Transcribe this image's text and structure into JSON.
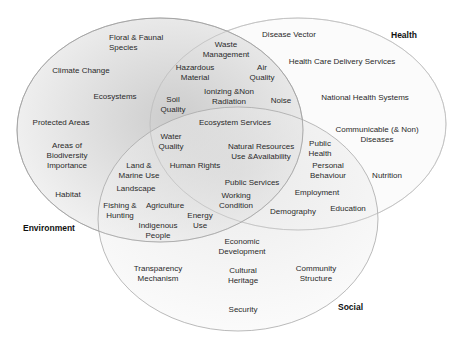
{
  "diagram": {
    "type": "venn",
    "sets": [
      {
        "name": "Environment",
        "fill": "#cfcfcf"
      },
      {
        "name": "Health",
        "fill": "#f2f2f2"
      },
      {
        "name": "Social",
        "fill": "#e6e6e6"
      }
    ],
    "labels": {
      "environment_only": [
        "Floral & Faunal Species",
        "Climate Change",
        "Ecosystems",
        "Protected Areas",
        "Areas of Biodiversity Importance",
        "Habitat"
      ],
      "environment_health": [
        "Waste Management",
        "Hazardous Material",
        "Air Quality",
        "Ionizing &Non Radiation",
        "Soil Quality",
        "Noise"
      ],
      "all_three": [
        "Ecosystem Services",
        "Water Quality",
        "Natural Resources Use &Availability",
        "Human Rights",
        "Public Services",
        "Working Condition"
      ],
      "environment_social": [
        "Land & Marine Use",
        "Landscape",
        "Fishing & Hunting",
        "Agriculture",
        "Energy Use",
        "Indigenous People"
      ],
      "health_only": [
        "Disease Vector",
        "Health Care Delivery Services",
        "National Health Systems",
        "Communicable (& Non) Diseases",
        "Nutrition"
      ],
      "health_social": [
        "Public Health",
        "Personal Behaviour",
        "Employment",
        "Demography",
        "Education"
      ],
      "social_only": [
        "Economic Development",
        "Transparency Mechanism",
        "Cultural Heritage",
        "Community Structure",
        "Security"
      ]
    }
  },
  "items": {
    "floral": [
      "Floral & Faunal",
      "Species"
    ],
    "climate": "Climate Change",
    "ecosystems": "Ecosystems",
    "protected": "Protected Areas",
    "biodiv": [
      "Areas of",
      "Biodiversity",
      "Importance"
    ],
    "habitat": "Habitat",
    "waste": [
      "Waste",
      "Management"
    ],
    "hazard": [
      "Hazardous",
      "Material"
    ],
    "air": [
      "Air",
      "Quality"
    ],
    "ionizing": [
      "Ionizing &Non",
      "Radiation"
    ],
    "soil": [
      "Soil",
      "Quality"
    ],
    "noise": "Noise",
    "ecoserv": "Ecosystem Services",
    "water": [
      "Water",
      "Quality"
    ],
    "natres": [
      "Natural Resources",
      "Use &Availability"
    ],
    "landmarine": [
      "Land &",
      "Marine Use"
    ],
    "humanrights": "Human Rights",
    "landscape": "Landscape",
    "publicserv": "Public Services",
    "fishing": [
      "Fishing &",
      "Hunting"
    ],
    "agriculture": "Agriculture",
    "working": [
      "Working",
      "Condition"
    ],
    "energy": [
      "Energy",
      "Use"
    ],
    "indigenous": [
      "Indigenous",
      "People"
    ],
    "disease": "Disease Vector",
    "hcds": "Health Care Delivery Services",
    "nhs": "National Health Systems",
    "communicable": [
      "Communicable (& Non)",
      "Diseases"
    ],
    "publichealth": [
      "Public",
      "Health"
    ],
    "personal": [
      "Personal",
      "Behaviour"
    ],
    "nutrition": "Nutrition",
    "employment": "Employment",
    "demography": "Demography",
    "education": "Education",
    "economic": [
      "Economic",
      "Development"
    ],
    "transparency": [
      "Transparency",
      "Mechanism"
    ],
    "cultural": [
      "Cultural",
      "Heritage"
    ],
    "community": [
      "Community",
      "Structure"
    ],
    "security": "Security"
  },
  "set_labels": {
    "environment": "Environment",
    "health": "Health",
    "social": "Social"
  }
}
